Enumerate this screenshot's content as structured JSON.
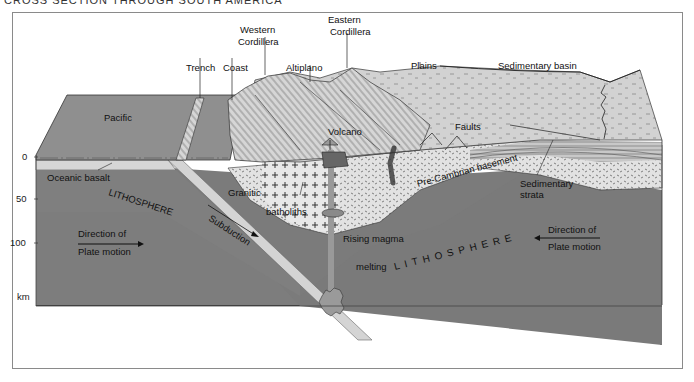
{
  "caption": "CROSS SECTION THROUGH SOUTH AMERICA",
  "labels": {
    "western_cordillera_1": "Western",
    "western_cordillera_2": "Cordillera",
    "eastern_cordillera_1": "Eastern",
    "eastern_cordillera_2": "Cordillera",
    "trench": "Trench",
    "coast": "Coast",
    "altiplano": "Altiplano",
    "plains": "Plains",
    "sedimentary_basin": "Sedimentary basin",
    "pacific": "Pacific",
    "volcano": "Volcano",
    "faults": "Faults",
    "oceanic_basalt": "Oceanic basalt",
    "lithosphere_left": "LITHOSPHERE",
    "granitic": "Granitic",
    "batholiths": "batholiths",
    "pre_cambrian_basement": "Pre-Cambrian basement",
    "sedimentary_strata_1": "Sedimentary",
    "sedimentary_strata_2": "strata",
    "subduction": "Subduction",
    "rising_magma": "Rising magma",
    "melting": "melting",
    "lithosphere_right": "LITHOSPHERE",
    "direction_left_1": "Direction of",
    "direction_left_2": "Plate motion",
    "direction_right_1": "Direction of",
    "direction_right_2": "Plate motion"
  },
  "depth_axis": {
    "ticks": [
      "0",
      "50",
      "100"
    ],
    "unit": "km"
  },
  "colors": {
    "ocean_surface": "#8e8e8e",
    "land_surface": "#cfcfcf",
    "crust_light": "#d9d9d9",
    "lithosphere": "#7b7b7b",
    "asthenosphere_dark": "#3e3e3e",
    "slab": "#d0d0d0"
  }
}
